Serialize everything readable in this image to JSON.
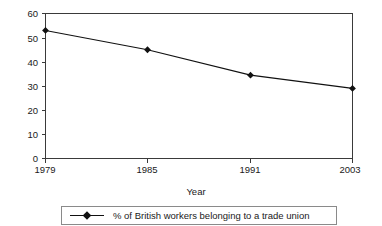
{
  "chart_data": {
    "type": "line",
    "title": "",
    "subtitle": "",
    "xlabel": "Year",
    "ylabel": "",
    "categories": [
      "1979",
      "1985",
      "1991",
      "2003"
    ],
    "x": [
      1979,
      1985,
      1991,
      2003
    ],
    "values": [
      53,
      45,
      34.5,
      29
    ],
    "series": [
      {
        "name": "% of British workers belonging to a trade union",
        "values": [
          53,
          45,
          34.5,
          29
        ]
      }
    ],
    "legend": [
      "% of British workers belonging to a trade union"
    ],
    "legend_position": "bottom",
    "ylim": [
      0,
      60
    ],
    "ytick_labels": [
      "0",
      "10",
      "20",
      "30",
      "40",
      "50",
      "60"
    ],
    "ytick_values": [
      0,
      10,
      20,
      30,
      40,
      50,
      60
    ],
    "xtick_labels": [
      "1979",
      "1985",
      "1991",
      "2003"
    ],
    "grid": false,
    "marker": "diamond",
    "line_color": "#111111",
    "axis_color": "#3a3a3a",
    "legend_border_color": "#8a8a8a",
    "background": "#ffffff"
  },
  "axes": {
    "x_title": "Year"
  },
  "legend": {
    "entry_label": "% of British workers belonging to a trade union"
  },
  "yticks": {
    "t0": "0",
    "t10": "10",
    "t20": "20",
    "t30": "30",
    "t40": "40",
    "t50": "50",
    "t60": "60"
  },
  "xticks": {
    "t1979": "1979",
    "t1985": "1985",
    "t1991": "1991",
    "t2003": "2003"
  }
}
